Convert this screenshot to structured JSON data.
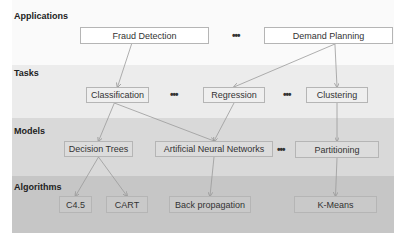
{
  "layers": [
    {
      "id": "applications",
      "label": "Applications",
      "color": "#fafafa"
    },
    {
      "id": "tasks",
      "label": "Tasks",
      "color": "#ececec"
    },
    {
      "id": "models",
      "label": "Models",
      "color": "#d9d9d9"
    },
    {
      "id": "algorithms",
      "label": "Algorithms",
      "color": "#c6c6c6"
    }
  ],
  "nodes": {
    "fraud_detection": "Fraud Detection",
    "demand_planning": "Demand Planning",
    "classification": "Classification",
    "regression": "Regression",
    "clustering": "Clustering",
    "decision_trees": "Decision Trees",
    "ann": "Artificial Neural Networks",
    "partitioning": "Partitioning",
    "c45": "C4.5",
    "cart": "CART",
    "back_propagation": "Back propagation",
    "k_means": "K-Means"
  },
  "ellipsis": "•••",
  "edges": [
    [
      "fraud_detection",
      "classification"
    ],
    [
      "demand_planning",
      "regression"
    ],
    [
      "demand_planning",
      "clustering"
    ],
    [
      "classification",
      "decision_trees"
    ],
    [
      "classification",
      "ann"
    ],
    [
      "regression",
      "ann"
    ],
    [
      "clustering",
      "partitioning"
    ],
    [
      "decision_trees",
      "c45"
    ],
    [
      "decision_trees",
      "cart"
    ],
    [
      "ann",
      "back_propagation"
    ],
    [
      "partitioning",
      "k_means"
    ]
  ]
}
